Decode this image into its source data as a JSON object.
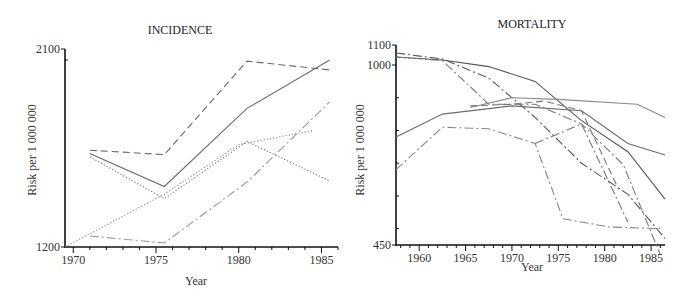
{
  "chart_data": [
    {
      "type": "line",
      "title": "INCIDENCE",
      "xlabel": "Year",
      "ylabel": "Risk per 1 000 000",
      "xlim": [
        1969.5,
        1986
      ],
      "ylim": [
        1200,
        2100
      ],
      "x_ticks": [
        1970,
        1975,
        1980,
        1985
      ],
      "y_tick_labels": [
        1200,
        2100
      ],
      "grid": false,
      "legend": "none",
      "series": [
        {
          "name": "series-dashed",
          "style": "dashed",
          "color": "#6b6b6b",
          "x": [
            1971,
            1975.5,
            1980.5,
            1985.5
          ],
          "y": [
            1640,
            1620,
            2045,
            2005
          ]
        },
        {
          "name": "series-solid",
          "style": "solid",
          "color": "#6b6b6b",
          "x": [
            1971,
            1975.5,
            1980.5,
            1985.5
          ],
          "y": [
            1625,
            1475,
            1830,
            2050
          ]
        },
        {
          "name": "series-dotted-a",
          "style": "dotted",
          "color": "#777777",
          "x": [
            1971,
            1975.5,
            1980.5,
            1985.5
          ],
          "y": [
            1610,
            1420,
            1680,
            1500
          ]
        },
        {
          "name": "series-dotted-b",
          "style": "dotted",
          "color": "#8a8a8a",
          "x": [
            1969.5,
            1975.5,
            1980,
            1984.5
          ],
          "y": [
            1200,
            1440,
            1665,
            1730
          ]
        },
        {
          "name": "series-dashdot",
          "style": "dashdot",
          "color": "#9a9a9a",
          "x": [
            1971,
            1975.5,
            1980.5,
            1985.5
          ],
          "y": [
            1250,
            1218,
            1495,
            1860
          ]
        }
      ]
    },
    {
      "type": "line",
      "title": "MORTALITY",
      "xlabel": "Year",
      "ylabel": "Risk per 1 000 000",
      "xlim": [
        1957.5,
        1986.5
      ],
      "ylim": [
        450,
        1100
      ],
      "x_ticks": [
        1960,
        1965,
        1970,
        1975,
        1980,
        1985
      ],
      "y_tick_labels": [
        450,
        1000,
        1100
      ],
      "grid": false,
      "legend": "none",
      "series": [
        {
          "name": "series-solid-a",
          "style": "solid",
          "color": "#555555",
          "x": [
            1957.5,
            1962.5,
            1967.5,
            1972.5,
            1977.5,
            1982.5,
            1986.5
          ],
          "y": [
            1040,
            1025,
            995,
            950,
            830,
            735,
            590
          ]
        },
        {
          "name": "series-dashdot-a",
          "style": "dashdot",
          "color": "#555555",
          "x": [
            1957.5,
            1962.5,
            1967.5,
            1972.5,
            1977.5,
            1982.5,
            1986.5
          ],
          "y": [
            1060,
            1030,
            960,
            840,
            700,
            605,
            470
          ]
        },
        {
          "name": "series-dashdot-b",
          "style": "dashdot",
          "color": "#777777",
          "x": [
            1957.5,
            1962.5,
            1967.5,
            1972.5,
            1977.5,
            1982,
            1986
          ],
          "y": [
            1040,
            1022,
            880,
            880,
            820,
            695,
            420
          ]
        },
        {
          "name": "series-solid-b",
          "style": "solid",
          "color": "#8a8a8a",
          "x": [
            1965.5,
            1970,
            1975,
            1983.5,
            1986.5
          ],
          "y": [
            870,
            900,
            895,
            880,
            840
          ]
        },
        {
          "name": "series-solid-c",
          "style": "solid",
          "color": "#6b6b6b",
          "x": [
            1957.5,
            1962.5,
            1970,
            1977.5,
            1982.5,
            1986.5
          ],
          "y": [
            780,
            850,
            875,
            860,
            760,
            725
          ]
        },
        {
          "name": "series-dashed-a",
          "style": "dashed",
          "color": "#777777",
          "x": [
            1965.5,
            1970,
            1973.5,
            1977.5,
            1981.5
          ],
          "y": [
            875,
            880,
            890,
            860,
            620
          ]
        },
        {
          "name": "series-dashdot-c",
          "style": "dashdot",
          "color": "#888888",
          "x": [
            1957.5,
            1962.5,
            1967.5,
            1972.5,
            1975.5,
            1980.5,
            1986
          ],
          "y": [
            680,
            810,
            805,
            760,
            530,
            505,
            500
          ]
        },
        {
          "name": "series-dashdot-d",
          "style": "dashdot",
          "color": "#777777",
          "x": [
            1972.5,
            1977.5,
            1982.5
          ],
          "y": [
            760,
            820,
            520
          ]
        }
      ]
    }
  ]
}
